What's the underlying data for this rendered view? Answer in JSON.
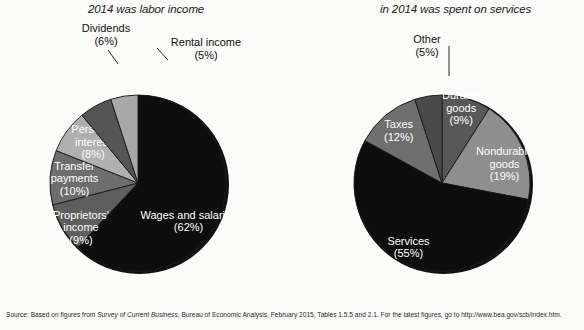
{
  "figure": {
    "background_color": "#fbfbfa",
    "source_prefix": "Source: Based on figures from ",
    "source_italic": "Survey of Current Business",
    "source_suffix": ", Bureau of Economic Analysis, February 2015, Tables 1.5.5 and 2.1. For the latest figures, go to http://www.bea.gov/scb/index.htm."
  },
  "chart_data": [
    {
      "type": "pie",
      "id": "labor-income",
      "title": "2014 was labor income",
      "start_angle_deg": 0,
      "direction": "clockwise",
      "center": [
        138,
        147
      ],
      "radius": 88,
      "categories": [
        "Wages and salaries",
        "Proprietors' income",
        "Transfer payments",
        "Personal interest",
        "Dividends",
        "Rental income"
      ],
      "values": [
        62,
        9,
        10,
        8,
        6,
        5
      ],
      "value_unit": "%",
      "colors": [
        "#0d0d0d",
        "#5e5e5e",
        "#6e6e6e",
        "#b0b0b0",
        "#555555",
        "#a8a8a8"
      ],
      "slices": [
        {
          "label": "Wages and salaries",
          "pct": 62,
          "pct_text": "(62%)",
          "color": "#0d0d0d",
          "label_placement": "inside",
          "label_color": "#ffffff"
        },
        {
          "label": "Proprietors'",
          "label_line2": "income",
          "pct": 9,
          "pct_text": "(9%)",
          "color": "#5e5e5e",
          "label_placement": "inside",
          "label_color": "#ffffff"
        },
        {
          "label": "Transfer",
          "label_line2": "payments",
          "pct": 10,
          "pct_text": "(10%)",
          "color": "#6e6e6e",
          "label_placement": "inside",
          "label_color": "#ffffff"
        },
        {
          "label": "Personal",
          "label_line2": "interest",
          "pct": 8,
          "pct_text": "(8%)",
          "color": "#b0b0b0",
          "label_placement": "inside",
          "label_color": "#ffffff"
        },
        {
          "label": "Dividends",
          "pct": 6,
          "pct_text": "(6%)",
          "color": "#555555",
          "label_placement": "outside",
          "label_color": "#111111"
        },
        {
          "label": "Rental income",
          "pct": 5,
          "pct_text": "(5%)",
          "color": "#a8a8a8",
          "label_placement": "outside",
          "label_color": "#111111"
        }
      ]
    },
    {
      "type": "pie",
      "id": "consumption-services",
      "title": "in 2014 was spent on services",
      "start_angle_deg": 0,
      "direction": "clockwise",
      "center": [
        150,
        147
      ],
      "radius": 88,
      "categories": [
        "Durable goods",
        "Nondurable goods",
        "Services",
        "Taxes",
        "Other"
      ],
      "values": [
        9,
        19,
        55,
        12,
        5
      ],
      "value_unit": "%",
      "colors": [
        "#585858",
        "#8e8e8e",
        "#0d0d0d",
        "#6f6f6f",
        "#4a4a4a"
      ],
      "slices": [
        {
          "label": "Durable",
          "label_line2": "goods",
          "pct": 9,
          "pct_text": "(9%)",
          "color": "#585858",
          "label_placement": "inside",
          "label_color": "#ffffff"
        },
        {
          "label": "Nondurable",
          "label_line2": "goods",
          "pct": 19,
          "pct_text": "(19%)",
          "color": "#8e8e8e",
          "label_placement": "inside",
          "label_color": "#ffffff"
        },
        {
          "label": "Services",
          "pct": 55,
          "pct_text": "(55%)",
          "color": "#0d0d0d",
          "label_placement": "inside",
          "label_color": "#ffffff"
        },
        {
          "label": "Taxes",
          "pct": 12,
          "pct_text": "(12%)",
          "color": "#6f6f6f",
          "label_placement": "inside",
          "label_color": "#ffffff"
        },
        {
          "label": "Other",
          "pct": 5,
          "pct_text": "(5%)",
          "color": "#4a4a4a",
          "label_placement": "outside",
          "label_color": "#111111"
        }
      ]
    }
  ],
  "labels": {
    "left": {
      "dividends_name": "Dividends",
      "dividends_pct": "(6%)",
      "rental_name": "Rental income",
      "rental_pct": "(5%)"
    },
    "right": {
      "other_name": "Other",
      "other_pct": "(5%)"
    }
  }
}
